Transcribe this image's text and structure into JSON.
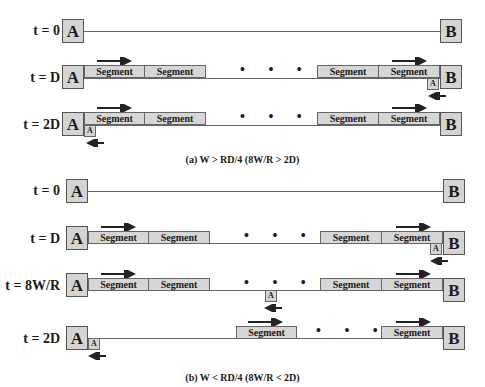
{
  "figure": {
    "panel_a": {
      "caption": "(a) W > RD/4 (8W/R > 2D)",
      "rows": [
        {
          "time_label": "t = 0",
          "node_a": "A",
          "node_b": "B"
        },
        {
          "time_label": "t = D",
          "node_a": "A",
          "node_b": "B",
          "segments_left": [
            "Segment",
            "Segment"
          ],
          "segments_right": [
            "Segment",
            "Segment"
          ],
          "ack": "A",
          "ack_position": "at B"
        },
        {
          "time_label": "t = 2D",
          "node_a": "A",
          "node_b": "B",
          "segments_left": [
            "Segment",
            "Segment"
          ],
          "segments_right": [
            "Segment",
            "Segment"
          ],
          "ack": "A",
          "ack_position": "at A"
        }
      ]
    },
    "panel_b": {
      "caption": "(b) W < RD/4 (8W/R < 2D)",
      "rows": [
        {
          "time_label": "t = 0",
          "node_a": "A",
          "node_b": "B"
        },
        {
          "time_label": "t = D",
          "node_a": "A",
          "node_b": "B",
          "segments_left": [
            "Segment",
            "Segment"
          ],
          "segments_right": [
            "Segment",
            "Segment"
          ],
          "ack": "A",
          "ack_position": "at B"
        },
        {
          "time_label": "t = 8W/R",
          "node_a": "A",
          "node_b": "B",
          "segments_left": [
            "Segment",
            "Segment"
          ],
          "segments_right": [
            "Segment",
            "Segment"
          ],
          "ack": "A",
          "ack_position": "middle"
        },
        {
          "time_label": "t = 2D",
          "node_a": "A",
          "node_b": "B",
          "segments_mid": [
            "Segment"
          ],
          "segments_right": [
            "Segment"
          ],
          "ack": "A",
          "ack_position": "at A"
        }
      ]
    },
    "ellipsis": "• • •",
    "colors": {
      "box_fill": "#d4d4d4",
      "line": "#666666",
      "text": "#1a1a1a"
    }
  }
}
